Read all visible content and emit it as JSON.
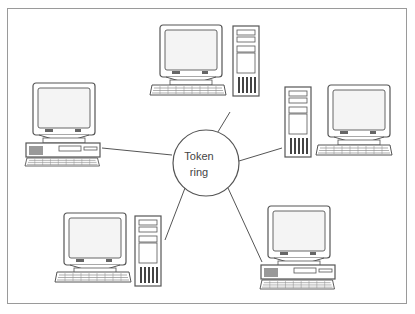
{
  "diagram": {
    "center": {
      "label_line1": "Token",
      "label_line2": "ring"
    },
    "nodes": [
      {
        "id": "top",
        "type": "workstation-tower"
      },
      {
        "id": "left",
        "type": "workstation-desktop"
      },
      {
        "id": "right",
        "type": "workstation-tower"
      },
      {
        "id": "bottom-left",
        "type": "workstation-tower"
      },
      {
        "id": "bottom-right",
        "type": "workstation-desktop"
      }
    ],
    "colors": {
      "stroke": "#555555",
      "fill": "#ffffff",
      "screen": "#f4f4f4",
      "frame": "#9a9a9a"
    }
  }
}
